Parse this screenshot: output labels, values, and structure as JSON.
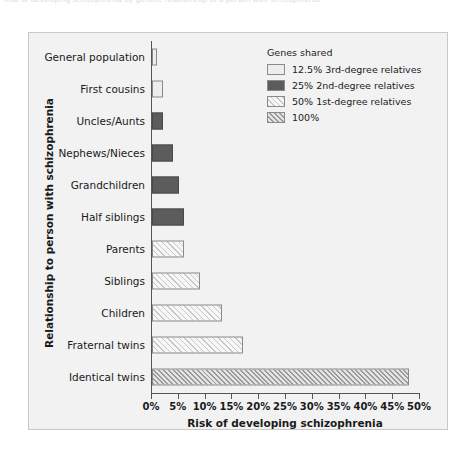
{
  "caption": {
    "text": "Risk of developing schizophrenia by genetic relationship to a person with schizophrenia"
  },
  "figure": {
    "y_axis_title": "Relationship to person with schizophrenia",
    "x_axis_title": "Risk of developing schizophrenia"
  },
  "legend": {
    "title": "Genes shared",
    "items": [
      {
        "label": "12.5% 3rd-degree relatives",
        "fill": "f-12",
        "swatch_name": "legend-swatch-12-percent"
      },
      {
        "label": "25% 2nd-degree relatives",
        "fill": "f-25",
        "swatch_name": "legend-swatch-25-percent"
      },
      {
        "label": "50% 1st-degree relatives",
        "fill": "f-50",
        "swatch_name": "legend-swatch-50-percent"
      },
      {
        "label": "100%",
        "fill": "f-100",
        "swatch_name": "legend-swatch-100-percent"
      }
    ]
  },
  "chart_data": {
    "type": "bar",
    "orientation": "horizontal",
    "title": "",
    "xlabel": "Risk of developing schizophrenia",
    "ylabel": "Relationship to person with schizophrenia",
    "xlim": [
      0,
      50
    ],
    "xtick_labels": [
      "0%",
      "5%",
      "10%",
      "15%",
      "20%",
      "25%",
      "30%",
      "35%",
      "40%",
      "45%",
      "50%"
    ],
    "xticks": [
      0,
      5,
      10,
      15,
      20,
      25,
      30,
      35,
      40,
      45,
      50
    ],
    "grid": false,
    "legend_position": "upper right",
    "categories": [
      "General population",
      "First cousins",
      "Uncles/Aunts",
      "Nephews/Nieces",
      "Grandchildren",
      "Half siblings",
      "Parents",
      "Siblings",
      "Children",
      "Fraternal twins",
      "Identical twins"
    ],
    "values": [
      1,
      2,
      2,
      4,
      5,
      6,
      6,
      9,
      13,
      17,
      48
    ],
    "group_of_bar": [
      "12.5% 3rd-degree relatives",
      "12.5% 3rd-degree relatives",
      "25% 2nd-degree relatives",
      "25% 2nd-degree relatives",
      "25% 2nd-degree relatives",
      "25% 2nd-degree relatives",
      "50% 1st-degree relatives",
      "50% 1st-degree relatives",
      "50% 1st-degree relatives",
      "50% 1st-degree relatives",
      "100%"
    ],
    "bar_fill_class": [
      "f-12",
      "f-12",
      "f-25",
      "f-25",
      "f-25",
      "f-25",
      "f-50",
      "f-50",
      "f-50",
      "f-50",
      "f-100"
    ],
    "colors": {
      "light": "#ededed",
      "dark_gray": "#5c5c5c",
      "hatch_light": "#c7c7c7",
      "hatch_dense": "#9a9a9a",
      "plot_background": "#f2f2f2",
      "axis": "#555555",
      "text": "#1a1a1a"
    }
  }
}
